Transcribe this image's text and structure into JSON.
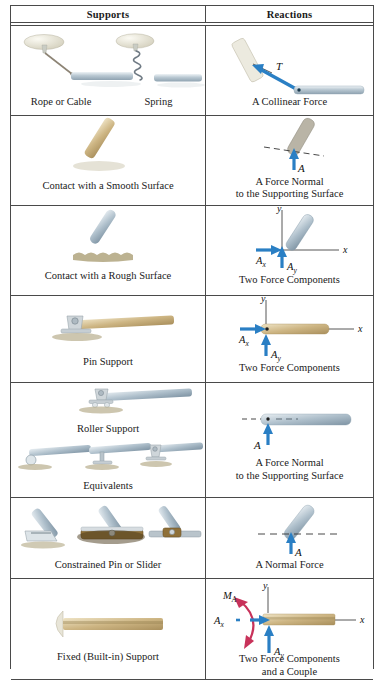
{
  "table": {
    "header": {
      "supports": "Supports",
      "reactions": "Reactions"
    },
    "rows": [
      {
        "id": "rope-spring",
        "support_captions": [
          "Rope or Cable",
          "Spring"
        ],
        "reaction_caption": "A Collinear Force",
        "reaction_labels": [
          "T"
        ],
        "support_art": "wall-bracket-rope-and-spring-to-beam",
        "reaction_art": "inclined-beam-with-tension-arrow"
      },
      {
        "id": "smooth-surface",
        "support_captions": [
          "Contact with a Smooth Surface"
        ],
        "reaction_caption": "A Force Normal\nto the Supporting Surface",
        "reaction_caption_line1": "A Force Normal",
        "reaction_caption_line2": "to the Supporting Surface",
        "reaction_labels": [
          "A"
        ],
        "support_art": "rod-resting-on-smooth-surface",
        "reaction_art": "rod-with-normal-force-arrow"
      },
      {
        "id": "rough-surface",
        "support_captions": [
          "Contact with a Rough Surface"
        ],
        "reaction_caption": "Two Force Components",
        "reaction_labels": [
          "A_x",
          "A_y",
          "x",
          "y"
        ],
        "support_art": "rod-resting-on-rough-surface",
        "reaction_art": "rod-with-x-and-y-force-components"
      },
      {
        "id": "pin-support",
        "support_captions": [
          "Pin Support"
        ],
        "reaction_caption": "Two Force Components",
        "reaction_labels": [
          "A_x",
          "A_y",
          "x",
          "y"
        ],
        "support_art": "pinned-beam-on-pedestal",
        "reaction_art": "beam-with-x-and-y-force-components"
      },
      {
        "id": "roller-support",
        "support_captions": [
          "Roller Support",
          "Equivalents"
        ],
        "reaction_caption_line1": "A Force Normal",
        "reaction_caption_line2": "to the Supporting Surface",
        "reaction_labels": [
          "A"
        ],
        "support_art": "roller-support-and-three-equivalents",
        "reaction_art": "beam-end-with-normal-force-arrow"
      },
      {
        "id": "constrained-pin-slider",
        "support_captions": [
          "Constrained Pin or Slider"
        ],
        "reaction_caption": "A Normal Force",
        "reaction_labels": [
          "A"
        ],
        "support_art": "three-constrained-pin-or-slider-variants",
        "reaction_art": "inclined-bar-in-slot-with-normal-force"
      },
      {
        "id": "fixed-support",
        "support_captions": [
          "Fixed (Built-in) Support"
        ],
        "reaction_caption_line1": "Two Force Components",
        "reaction_caption_line2": "and a Couple",
        "reaction_labels": [
          "A_x",
          "A_y",
          "M_A",
          "x",
          "y"
        ],
        "support_art": "beam-built-into-wall",
        "reaction_art": "beam-with-two-components-and-couple-moment"
      }
    ]
  },
  "symbols": {
    "T": "T",
    "A": "A",
    "A_base": "A",
    "sub_x": "x",
    "sub_y": "y",
    "M": "M",
    "sub_A": "A",
    "axis_x": "x",
    "axis_y": "y"
  },
  "colors": {
    "force_arrow_blue": "#2a7fc4",
    "moment_arrow_red": "#c8325a",
    "rule": "#4a4a4a",
    "steel_light": "#d7dde1",
    "steel_mid": "#9fb0bc",
    "wood_light": "#d9c79a",
    "wood_mid": "#b39a5f",
    "ground_tan": "#b9ad86",
    "bracket_cream": "#e6e3d6",
    "text": "#1a1a1a"
  }
}
